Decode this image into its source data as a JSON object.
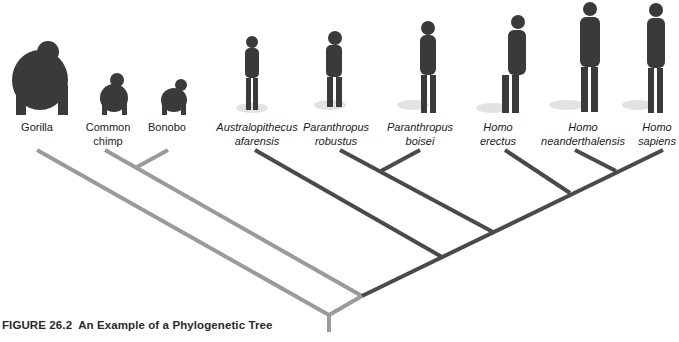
{
  "figure": {
    "caption_number": "FIGURE 26.2",
    "caption_title": "An Example of a Phylogenetic Tree"
  },
  "taxa": [
    {
      "id": "gorilla",
      "line1": "Gorilla",
      "line2": "",
      "italic": false,
      "x": 37
    },
    {
      "id": "common-chimp",
      "line1": "Common",
      "line2": "chimp",
      "italic": false,
      "x": 105
    },
    {
      "id": "bonobo",
      "line1": "Bonobo",
      "line2": "",
      "italic": false,
      "x": 168
    },
    {
      "id": "australopithecus-afarensis",
      "line1": "Australopithecus",
      "line2": "afarensis",
      "italic": true,
      "x": 255
    },
    {
      "id": "paranthropus-robustus",
      "line1": "Paranthropus",
      "line2": "robustus",
      "italic": true,
      "x": 340
    },
    {
      "id": "paranthropus-boisei",
      "line1": "Paranthropus",
      "line2": "boisei",
      "italic": true,
      "x": 425
    },
    {
      "id": "homo-erectus",
      "line1": "Homo",
      "line2": "erectus",
      "italic": true,
      "x": 505
    },
    {
      "id": "homo-neanderthalensis",
      "line1": "Homo",
      "line2": "neanderthalensis",
      "italic": true,
      "x": 582
    },
    {
      "id": "homo-sapiens",
      "line1": "Homo",
      "line2": "sapiens",
      "italic": true,
      "x": 655
    }
  ],
  "colors": {
    "ape_branch": "#9a9a9a",
    "hominin_branch": "#4a4a4a",
    "text": "#1a1a1a",
    "background": "#ffffff"
  }
}
